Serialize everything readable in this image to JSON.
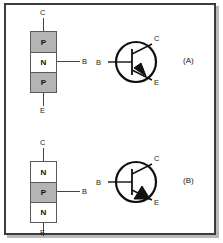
{
  "figure": {
    "background_color": "#ffffff",
    "frame_color": "#3b3b3b",
    "shade_color": "#b4b4b4",
    "line_color": "#444444"
  },
  "panels": [
    {
      "id": "panel-a",
      "label": "(A)",
      "device_type": "PNP",
      "block_diagram": {
        "layers": [
          {
            "text": "P",
            "shade": "gray"
          },
          {
            "text": "N",
            "shade": "white"
          },
          {
            "text": "P",
            "shade": "gray"
          }
        ],
        "terminals": {
          "collector": "C",
          "base": "B",
          "emitter": "E"
        }
      },
      "symbol": {
        "terminals": {
          "collector": "C",
          "base": "B",
          "emitter": "E"
        },
        "arrow_direction": "inward"
      }
    },
    {
      "id": "panel-b",
      "label": "(B)",
      "device_type": "NPN",
      "block_diagram": {
        "layers": [
          {
            "text": "N",
            "shade": "white"
          },
          {
            "text": "P",
            "shade": "gray"
          },
          {
            "text": "N",
            "shade": "white"
          }
        ],
        "terminals": {
          "collector": "C",
          "base": "B",
          "emitter": "E"
        }
      },
      "symbol": {
        "terminals": {
          "collector": "C",
          "base": "B",
          "emitter": "E"
        },
        "arrow_direction": "outward"
      }
    }
  ]
}
